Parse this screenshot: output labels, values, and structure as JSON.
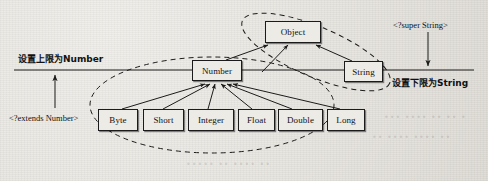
{
  "diagram": {
    "background_color": "#e9e7e3",
    "line_color": "#1b1b1b",
    "node_fill": "#edebe6",
    "nodes": [
      {
        "id": "object",
        "label": "Object",
        "x": 265,
        "y": 21,
        "w": 56,
        "h": 22
      },
      {
        "id": "number",
        "label": "Number",
        "x": 192,
        "y": 60,
        "w": 50,
        "h": 21
      },
      {
        "id": "string",
        "label": "String",
        "x": 344,
        "y": 61,
        "w": 39,
        "h": 21
      },
      {
        "id": "byte",
        "label": "Byte",
        "x": 98,
        "y": 109,
        "w": 40,
        "h": 22
      },
      {
        "id": "short",
        "label": "Short",
        "x": 143,
        "y": 109,
        "w": 41,
        "h": 22
      },
      {
        "id": "integer",
        "label": "Integer",
        "x": 188,
        "y": 109,
        "w": 46,
        "h": 22
      },
      {
        "id": "float",
        "label": "Float",
        "x": 238,
        "y": 109,
        "w": 37,
        "h": 22
      },
      {
        "id": "double",
        "label": "Double",
        "x": 278,
        "y": 109,
        "w": 45,
        "h": 22
      },
      {
        "id": "long",
        "label": "Long",
        "x": 327,
        "y": 109,
        "w": 38,
        "h": 22
      }
    ],
    "labels": [
      {
        "id": "upper-bound-note",
        "text": "设置上限为Number",
        "x": 18,
        "y": 52,
        "style": "cjk"
      },
      {
        "id": "extends-wildcard",
        "text": "<?extends Number>",
        "x": 9,
        "y": 113,
        "style": "code"
      },
      {
        "id": "super-wildcard",
        "text": "<?super String>",
        "x": 393,
        "y": 20,
        "style": "code"
      },
      {
        "id": "lower-bound-note",
        "text": "设置下限为String",
        "x": 392,
        "y": 76,
        "style": "cjk"
      }
    ],
    "baseline": {
      "y": 70,
      "x_start": 14,
      "x_end": 474
    },
    "arrows_on_baseline": [
      {
        "id": "extends-arrow",
        "direction": "up",
        "x": 55,
        "from_y": 108,
        "to_y": 73
      },
      {
        "id": "super-arrow",
        "direction": "down",
        "x": 428,
        "from_y": 32,
        "to_y": 67
      }
    ],
    "inheritance_edges": [
      {
        "from": "number",
        "to": "object"
      },
      {
        "from": "string",
        "to": "object"
      },
      {
        "from": "byte",
        "to": "number"
      },
      {
        "from": "short",
        "to": "number"
      },
      {
        "from": "integer",
        "to": "number"
      },
      {
        "from": "float",
        "to": "number"
      },
      {
        "from": "double",
        "to": "number"
      },
      {
        "from": "long",
        "to": "number"
      }
    ],
    "dashed_ellipses": [
      {
        "id": "extends-bound-ellipse",
        "cx": 212,
        "cy": 105,
        "rx": 122,
        "ry": 48,
        "rotate": 0
      },
      {
        "id": "super-bound-ellipse",
        "cx": 316,
        "cy": 52,
        "rx": 80,
        "ry": 25,
        "rotate": 23
      }
    ],
    "ghost_text": [
      {
        "text": "•••  •••• ••  •• •",
        "x": 384,
        "y": 113
      },
      {
        "text": "•• ••••  •••• ••",
        "x": 372,
        "y": 133
      },
      {
        "text": "•••••  •• •••• ••",
        "x": 186,
        "y": 160
      }
    ]
  }
}
